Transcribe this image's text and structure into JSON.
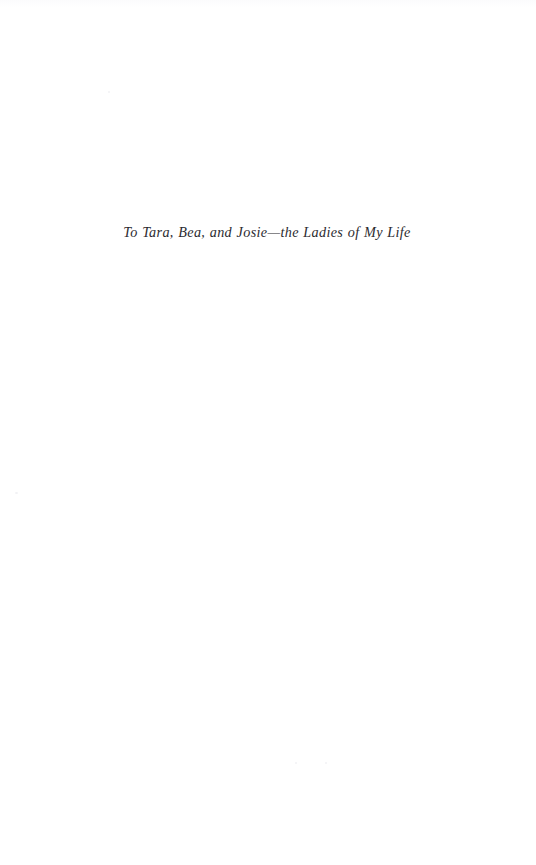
{
  "page": {
    "type": "book-dedication-page",
    "background_color": "#ffffff",
    "ink_color": "#2b2b30",
    "width": 536,
    "height": 865
  },
  "dedication": {
    "text": "To Tara, Bea, and Josie—the Ladies of My Life"
  },
  "artifacts": {
    "specks": [
      {
        "x": 15,
        "y": 492,
        "size": 3
      },
      {
        "x": 108,
        "y": 91,
        "size": 2
      },
      {
        "x": 295,
        "y": 762,
        "size": 2
      },
      {
        "x": 325,
        "y": 762,
        "size": 2
      }
    ]
  }
}
